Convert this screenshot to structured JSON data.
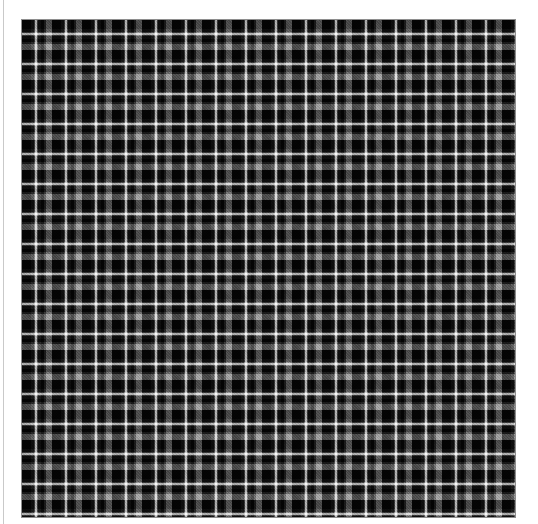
{
  "page": {
    "title_text": "Gunner",
    "background_color": "#ffffff",
    "edge_rule_color": "#c9c9c9",
    "title_note": "heading is clipped at the top edge of the screenshot; only the lower portion of the glyphs is visible"
  },
  "swatch": {
    "name": "tartan-swatch",
    "label": "Grayscale tartan plaid swatch",
    "border_color": "#8e8e8e",
    "width_px": 495,
    "height_px": 499,
    "sett_repeat_px": 30,
    "weave": "twill",
    "palette": {
      "black": "#050505",
      "charcoal": "#262626",
      "dark_gray": "#3e3e3e",
      "mid_gray": "#6e6e6e",
      "light_gray": "#8a8a8a",
      "white": "#f2f2f2"
    },
    "sett_bands": [
      {
        "color": "#050505",
        "name": "black",
        "width_px": 9
      },
      {
        "color": "#262626",
        "name": "charcoal",
        "width_px": 3
      },
      {
        "color": "#6e6e6e",
        "name": "mid-gray",
        "width_px": 1
      },
      {
        "color": "#f2f2f2",
        "name": "white",
        "width_px": 2
      },
      {
        "color": "#6e6e6e",
        "name": "mid-gray",
        "width_px": 1
      },
      {
        "color": "#262626",
        "name": "charcoal",
        "width_px": 3
      },
      {
        "color": "#050505",
        "name": "black",
        "width_px": 3
      },
      {
        "color": "#3e3e3e",
        "name": "dark-gray",
        "width_px": 2
      },
      {
        "color": "#8a8a8a",
        "name": "light-gray",
        "width_px": 6
      }
    ]
  }
}
